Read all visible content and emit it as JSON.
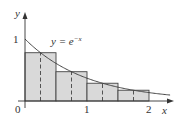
{
  "diagram": {
    "type": "midpoint-rule-approximation",
    "function_label": "y = e",
    "function_exponent": "−x",
    "axis_labels": {
      "x": "x",
      "y": "y"
    },
    "tick_labels": {
      "origin": "0",
      "x1": "1",
      "x2": "2",
      "y1": "1"
    },
    "interval": [
      0,
      2
    ],
    "n_rectangles": 4,
    "rectangles": [
      {
        "x0": 0,
        "x1": 0.5,
        "mid": 0.25,
        "height": 0.7788
      },
      {
        "x0": 0.5,
        "x1": 1.0,
        "mid": 0.75,
        "height": 0.4724
      },
      {
        "x0": 1.0,
        "x1": 1.5,
        "mid": 1.25,
        "height": 0.2865
      },
      {
        "x0": 1.5,
        "x1": 2.0,
        "mid": 1.75,
        "height": 0.1738
      }
    ],
    "colors": {
      "fill": "#d9d9d9",
      "stroke": "#444444",
      "curve": "#444444"
    }
  }
}
